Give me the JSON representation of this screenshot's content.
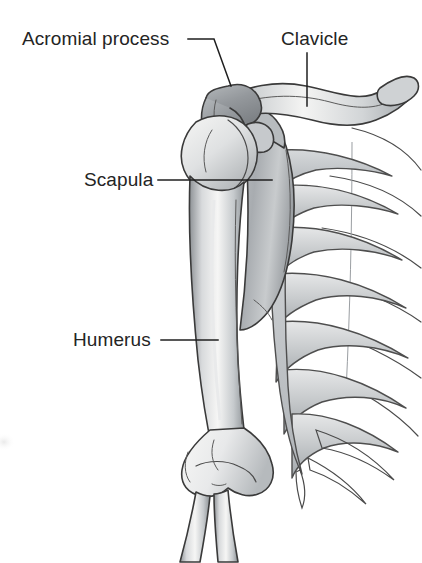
{
  "figure": {
    "background_color": "#ffffff",
    "label_color": "#242424",
    "leader_color": "#1f1f1f",
    "bone_outline_color": "#3a3a3a",
    "bone_fill_light": "#f2f2f1",
    "bone_fill_mid": "#c2c5c7",
    "bone_fill_dark": "#8e9295",
    "width": 422,
    "height": 563
  },
  "labels": [
    {
      "id": "acromial-process",
      "text": "Acromial process",
      "text_x": 22,
      "text_y": 45,
      "leader": "M 188 39 L 214 39 L 231 86"
    },
    {
      "id": "clavicle",
      "text": "Clavicle",
      "text_x": 281,
      "text_y": 45,
      "leader": "M 307 53 L 307 106"
    },
    {
      "id": "scapula",
      "text": "Scapula",
      "text_x": 84,
      "text_y": 186,
      "leader": "M 158 180 L 272 180"
    },
    {
      "id": "humerus",
      "text": "Humerus",
      "text_x": 73,
      "text_y": 346,
      "leader": "M 161 340 L 218 340"
    }
  ],
  "structures": [
    {
      "id": "clavicle-bone",
      "name": "clavicle"
    },
    {
      "id": "acromion",
      "name": "acromial process"
    },
    {
      "id": "scapula-body",
      "name": "scapula"
    },
    {
      "id": "humerus-bone",
      "name": "humerus"
    },
    {
      "id": "rib-cage",
      "name": "rib cage"
    },
    {
      "id": "radius-ulna",
      "name": "radius and ulna"
    }
  ]
}
